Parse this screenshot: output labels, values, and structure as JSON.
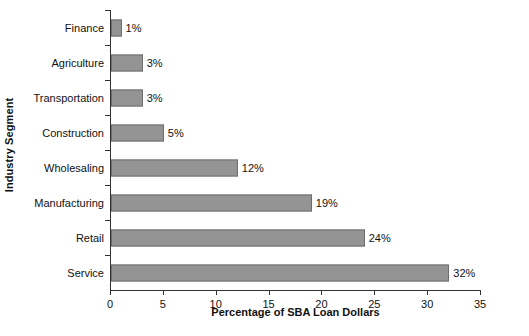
{
  "chart_data": {
    "type": "bar",
    "orientation": "horizontal",
    "title": "",
    "xlabel": "Percentage of SBA Loan Dollars",
    "ylabel": "Industry Segment",
    "categories": [
      "Finance",
      "Agriculture",
      "Transportation",
      "Construction",
      "Wholesaling",
      "Manufacturing",
      "Retail",
      "Service"
    ],
    "values": [
      1,
      3,
      3,
      5,
      12,
      19,
      24,
      32
    ],
    "value_labels": [
      "1%",
      "3%",
      "3%",
      "5%",
      "12%",
      "19%",
      "24%",
      "32%"
    ],
    "xlim": [
      0,
      35
    ],
    "x_ticks": [
      0,
      5,
      10,
      15,
      20,
      25,
      30,
      35
    ],
    "x_tick_labels": [
      "0",
      "5",
      "10",
      "15",
      "20",
      "25",
      "30",
      "35"
    ],
    "grid": false,
    "legend": false,
    "bar_color": "#949494",
    "bar_edge_color": "#6e6e6e",
    "axis_color": "#333333",
    "background_color": "#ffffff"
  }
}
